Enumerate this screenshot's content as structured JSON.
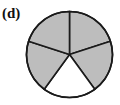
{
  "label": "(d)",
  "figure": {
    "type": "fraction-circle",
    "parts": 5,
    "shaded": 4,
    "unshaded_position": "bottom",
    "fill_color": "#bdbdbd",
    "empty_color": "#ffffff",
    "line_color": "#1a1a1a"
  }
}
